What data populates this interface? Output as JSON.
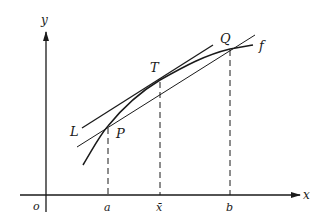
{
  "diagram": {
    "colors": {
      "ink": "#1a1a1a",
      "background": "#ffffff"
    },
    "axes": {
      "x_label": "x",
      "y_label": "y",
      "origin_label": "o"
    },
    "x_ticks": {
      "a": "a",
      "xbar": "x̄",
      "b": "b"
    },
    "points": {
      "P": "P",
      "T": "T",
      "Q": "Q"
    },
    "curve_label": "f",
    "line_label": "L"
  }
}
